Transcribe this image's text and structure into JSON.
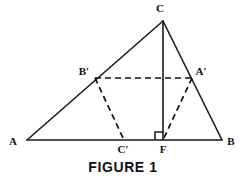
{
  "figure": {
    "caption": "FIGURE 1",
    "background_color": "#ffffff",
    "stroke_color": "#1a1a1a",
    "labels": {
      "A": "A",
      "B": "B",
      "C": "C",
      "A_prime": "A′",
      "B_prime": "B′",
      "C_prime": "C′",
      "F": "F"
    },
    "points": {
      "A": {
        "x": 27,
        "y": 140
      },
      "B": {
        "x": 222,
        "y": 140
      },
      "C": {
        "x": 163,
        "y": 21
      },
      "F": {
        "x": 163,
        "y": 140
      },
      "A_prime": {
        "x": 192,
        "y": 78
      },
      "B_prime": {
        "x": 95,
        "y": 78
      },
      "C_prime": {
        "x": 124,
        "y": 140
      }
    },
    "label_positions": {
      "A": {
        "x": 13,
        "y": 145
      },
      "B": {
        "x": 228,
        "y": 145
      },
      "C": {
        "x": 160,
        "y": 12
      },
      "A_prime": {
        "x": 196,
        "y": 74
      },
      "B_prime": {
        "x": 80,
        "y": 74
      },
      "C_prime": {
        "x": 119,
        "y": 153
      },
      "F": {
        "x": 159,
        "y": 153
      }
    },
    "solid_edges": [
      {
        "name": "edge-AB",
        "x1": 27,
        "y1": 140,
        "x2": 222,
        "y2": 140
      },
      {
        "name": "edge-AC",
        "x1": 27,
        "y1": 140,
        "x2": 163,
        "y2": 21
      },
      {
        "name": "edge-CB",
        "x1": 163,
        "y1": 21,
        "x2": 222,
        "y2": 140
      }
    ],
    "altitude": {
      "name": "altitude-CF",
      "x1": 163,
      "y1": 21,
      "x2": 163,
      "y2": 140
    },
    "dashed_edges": [
      {
        "name": "dashed-BprimeAprime",
        "x1": 95,
        "y1": 78,
        "x2": 192,
        "y2": 78
      },
      {
        "name": "dashed-BprimeCprime",
        "x1": 95,
        "y1": 78,
        "x2": 124,
        "y2": 140
      },
      {
        "name": "dashed-AprimeF",
        "x1": 192,
        "y1": 78,
        "x2": 163,
        "y2": 140
      }
    ],
    "right_angle": {
      "x": 155,
      "y": 132,
      "size": 8
    }
  }
}
